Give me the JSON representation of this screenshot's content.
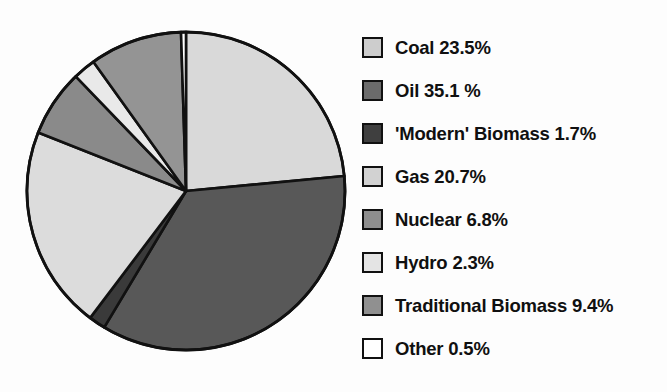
{
  "chart_data": {
    "type": "pie",
    "title": "",
    "subtitle": "",
    "xlabel": "",
    "ylabel": "",
    "legend_position": "right",
    "grid": false,
    "units": "percent",
    "start_angle_deg": 0,
    "direction": "clockwise",
    "categories": [
      "Coal",
      "Oil",
      "'Modern' Biomass",
      "Gas",
      "Nuclear",
      "Hydro",
      "Traditional Biomass",
      "Other"
    ],
    "values": [
      23.5,
      35.1,
      1.7,
      20.7,
      6.8,
      2.3,
      9.4,
      0.5
    ],
    "value_labels": [
      "23.5%",
      "35.1 %",
      "1.7%",
      "20.7%",
      "6.8%",
      "2.3%",
      "9.4%",
      "0.5%"
    ],
    "colors": [
      "#d9d9d9",
      "#585858",
      "#3a3a3a",
      "#dcdcdc",
      "#8a8a8a",
      "#e9e9e9",
      "#949494",
      "#ffffff"
    ],
    "slice_outline_color": "#111111",
    "total": 100.0
  },
  "legend": {
    "items": [
      {
        "label": "Coal 23.5%",
        "swatch_color": "#cdcdcd"
      },
      {
        "label": "Oil 35.1 %",
        "swatch_color": "#6b6b6b"
      },
      {
        "label": "'Modern' Biomass 1.7%",
        "swatch_color": "#3f3f3f"
      },
      {
        "label": "Gas 20.7%",
        "swatch_color": "#d2d2d2"
      },
      {
        "label": "Nuclear 6.8%",
        "swatch_color": "#8e8e8e"
      },
      {
        "label": "Hydro 2.3%",
        "swatch_color": "#e4e4e4"
      },
      {
        "label": "Traditional Biomass 9.4%",
        "swatch_color": "#909090"
      },
      {
        "label": "Other 0.5%",
        "swatch_color": "#ffffff"
      }
    ]
  }
}
